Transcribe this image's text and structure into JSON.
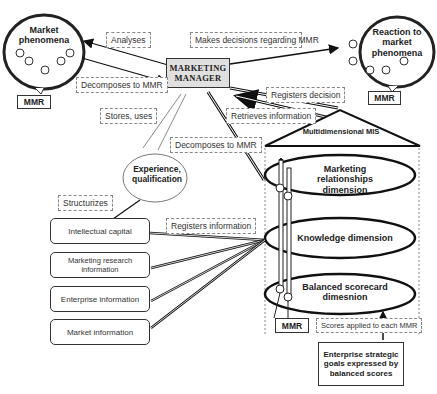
{
  "diagram": {
    "nodes": {
      "market_phenomena": "Market phenomena",
      "reaction": "Reaction to market phenomena",
      "manager": "MARKETING MANAGER",
      "experience": "Experience, qualification",
      "mis": "Multidimensional MIS",
      "dim_relationships": "Marketing relationships dimension",
      "dim_knowledge": "Knowledge dimension",
      "dim_scorecard": "Balanced scorecard dimesnion",
      "goals": "Enterprise strategic goals expressed by balanced scores",
      "mmr_left": "MMR",
      "mmr_right": "MMR",
      "mmr_bottom": "MMR"
    },
    "sources": [
      "Intellectual capital",
      "Marketing research information",
      "Enterprise information",
      "Market information"
    ],
    "edge_labels": {
      "analyses": "Analyses",
      "makes_decisions": "Makes decisions regarding MMR",
      "decomposes_left": "Decomposes to MMR",
      "registers_decision": "Registers decision",
      "retrieves": "Retrieves information",
      "stores_uses": "Stores, uses",
      "decomposes_mid": "Decomposes to MMR",
      "structurizes": "Structurizes",
      "registers_info": "Registers information",
      "scores_applied": "Scores applied to each MMR"
    }
  }
}
